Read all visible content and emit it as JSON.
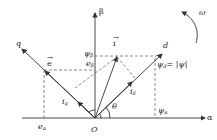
{
  "diagram": {
    "axes": {
      "alpha": "α",
      "beta": "β",
      "d": "d",
      "q": "q",
      "origin": "O"
    },
    "rotation": "ω",
    "angle": "θ",
    "vectors": {
      "current": "i",
      "emf": "e"
    },
    "labels": {
      "psi_beta": "ψ",
      "psi_beta_sub": "β",
      "e_beta": "e",
      "e_beta_sub": "β",
      "psi_d": "ψ",
      "psi_d_sub": "d",
      "psi_d_eq": "= |ψ|",
      "psi_alpha": "ψ",
      "psi_alpha_sub": "α",
      "e_alpha": "e",
      "e_alpha_sub": "α",
      "i_q": "i",
      "i_q_sub": "q",
      "i_d": "i",
      "i_d_sub": "d"
    },
    "colors": {
      "line": "#333333",
      "dash": "#555555"
    }
  }
}
